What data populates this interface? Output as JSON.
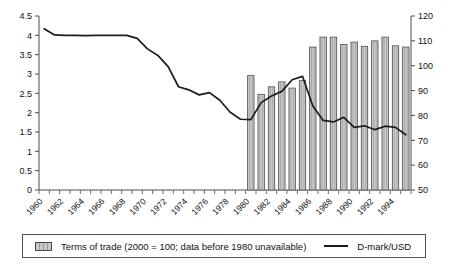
{
  "chart_data": {
    "type": "bar",
    "title": "",
    "xlabel": "",
    "ylabel": "",
    "grid": false,
    "legend_position": "bottom",
    "x": [
      1960,
      1961,
      1962,
      1963,
      1964,
      1965,
      1966,
      1967,
      1968,
      1969,
      1970,
      1971,
      1972,
      1973,
      1974,
      1975,
      1976,
      1977,
      1978,
      1979,
      1980,
      1981,
      1982,
      1983,
      1984,
      1985,
      1986,
      1987,
      1988,
      1989,
      1990,
      1991,
      1992,
      1993,
      1994,
      1995
    ],
    "tick_labels": [
      "1960",
      "1962",
      "1964",
      "1966",
      "1968",
      "1970",
      "1972",
      "1974",
      "1976",
      "1978",
      "1980",
      "1982",
      "1984",
      "1986",
      "1988",
      "1990",
      "1992",
      "1994"
    ],
    "left_axis": {
      "ylim": [
        0,
        4.5
      ],
      "ticks": [
        "0",
        "0.5",
        "1",
        "1.5",
        "2",
        "2.5",
        "3",
        "3.5",
        "4",
        "4.5"
      ],
      "tick_values": [
        0,
        0.5,
        1,
        1.5,
        2,
        2.5,
        3,
        3.5,
        4,
        4.5
      ]
    },
    "right_axis": {
      "ylim": [
        50,
        120
      ],
      "ticks": [
        "50",
        "60",
        "70",
        "80",
        "90",
        "100",
        "110",
        "120"
      ],
      "tick_values": [
        50,
        60,
        70,
        80,
        90,
        100,
        110,
        120
      ]
    },
    "series": [
      {
        "name": "Terms of trade (2000 = 100; data before 1980 unavailable)",
        "type": "bar",
        "axis": "right",
        "color": "#c9c9c9",
        "values": [
          null,
          null,
          null,
          null,
          null,
          null,
          null,
          null,
          null,
          null,
          null,
          null,
          null,
          null,
          null,
          null,
          null,
          null,
          null,
          null,
          96.0,
          88.5,
          91.5,
          93.5,
          91.0,
          94.0,
          107.5,
          111.5,
          111.5,
          108.5,
          109.5,
          107.8,
          110.0,
          111.5,
          108.0,
          107.5
        ]
      },
      {
        "name": "D-mark/USD",
        "type": "line",
        "axis": "left",
        "color": "#1c1c1c",
        "values": [
          4.17,
          4.01,
          4.0,
          4.0,
          3.99,
          4.0,
          4.0,
          4.0,
          4.0,
          3.92,
          3.65,
          3.48,
          3.19,
          2.67,
          2.59,
          2.46,
          2.52,
          2.32,
          2.01,
          1.83,
          1.82,
          2.26,
          2.43,
          2.55,
          2.85,
          2.94,
          2.17,
          1.8,
          1.76,
          1.88,
          1.62,
          1.66,
          1.56,
          1.65,
          1.62,
          1.43
        ]
      }
    ]
  },
  "legend": {
    "bar_label": "Terms of trade (2000 = 100; data before 1980 unavailable)",
    "line_label": "D-mark/USD"
  }
}
